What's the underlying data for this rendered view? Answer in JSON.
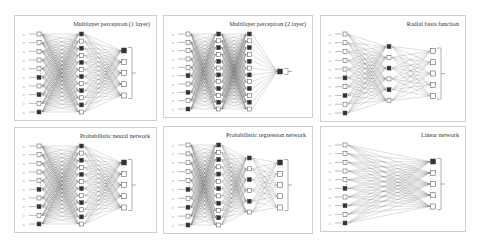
{
  "figure": {
    "panels": [
      {
        "id": "mlp1",
        "title": "Multilayer perceptron (1 layer)",
        "layers": [
          10,
          12,
          5
        ],
        "box": [
          14,
          15,
          143,
          106
        ]
      },
      {
        "id": "mlp2",
        "title": "Multilayer perceptron (2 layer)",
        "layers": [
          10,
          12,
          12,
          1
        ],
        "box": [
          163,
          15,
          150,
          103
        ]
      },
      {
        "id": "rbf",
        "title": "Radial basis function",
        "layers": [
          10,
          6,
          5
        ],
        "box": [
          320,
          15,
          146,
          107
        ]
      },
      {
        "id": "pnn",
        "title": "Probabilistic neural network",
        "layers": [
          10,
          12,
          5
        ],
        "box": [
          14,
          127,
          143,
          106
        ]
      },
      {
        "id": "grnn",
        "title": "Probabilistic regression network",
        "layers": [
          10,
          12,
          6,
          5
        ],
        "box": [
          163,
          126,
          150,
          108
        ]
      },
      {
        "id": "linear",
        "title": "Linear network",
        "layers": [
          10,
          5
        ],
        "box": [
          320,
          126,
          146,
          106
        ]
      }
    ]
  }
}
